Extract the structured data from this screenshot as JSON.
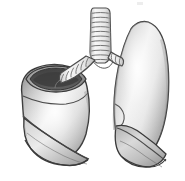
{
  "image": {
    "title": "Human Lungs Anatomical Illustration",
    "subject": "lungs",
    "style": "grayscale shaded line drawing",
    "background_color": "#ffffff",
    "width": 185,
    "height": 181
  },
  "palette": {
    "outline": "#3a3a3a",
    "fill_light": "#f2f2f2",
    "fill_mid": "#b8b8b8",
    "fill_dark": "#8c8c8c",
    "cavity_dark": "#4a4a4a",
    "cavity_shadow": "#5f5f5f",
    "cartilage_light": "#ededed",
    "cartilage_line": "#6e6e6e",
    "highlight": "#fbfbfb"
  },
  "parts": [
    {
      "id": "trachea",
      "label": "Trachea",
      "icon": "trachea-icon",
      "description": "Vertical airway with stacked cartilage rings descending from top center",
      "ring_count": 11
    },
    {
      "id": "carina",
      "label": "Carina",
      "icon": "carina-icon",
      "description": "Bifurcation point where the trachea splits into left and right main bronchi"
    },
    {
      "id": "left-main-bronchus",
      "label": "Left Main Bronchus",
      "icon": "bronchus-left-icon",
      "description": "Ringed tube angling down and to the viewer's left into the cut lung",
      "ring_count": 6
    },
    {
      "id": "right-main-bronchus",
      "label": "Right Main Bronchus",
      "icon": "bronchus-right-icon",
      "description": "Short ringed tube entering the hilum of the viewer's right lung",
      "ring_count": 3
    },
    {
      "id": "left-lung",
      "label": "Left Lung (viewer's left, sectioned)",
      "icon": "lung-left-icon",
      "description": "Lung shown with its apex cut away revealing a dark hollow interior; two oblique fissure lines cross the lower body"
    },
    {
      "id": "right-lung",
      "label": "Right Lung (viewer's right)",
      "icon": "lung-right-icon",
      "description": "Tall intact lung with pointed apex, concave medial border and a lower lobe separated by an oblique fissure"
    },
    {
      "id": "left-lung-cavity",
      "label": "Sectioned Lung Cavity",
      "icon": "cavity-icon",
      "description": "Dark elliptical opening at the cut surface of the left lung"
    },
    {
      "id": "left-oblique-fissure",
      "label": "Oblique Fissure (left)",
      "icon": "fissure-icon",
      "description": "Curved line dividing the lobes of the sectioned lung"
    },
    {
      "id": "right-oblique-fissure",
      "label": "Oblique Fissure (right)",
      "icon": "fissure-icon",
      "description": "Curved line dividing the lobes of the right lung"
    },
    {
      "id": "diaphragmatic-surface",
      "label": "Diaphragmatic Surface",
      "icon": "base-icon",
      "description": "Concave bases of both lungs at the bottom of the illustration"
    }
  ]
}
